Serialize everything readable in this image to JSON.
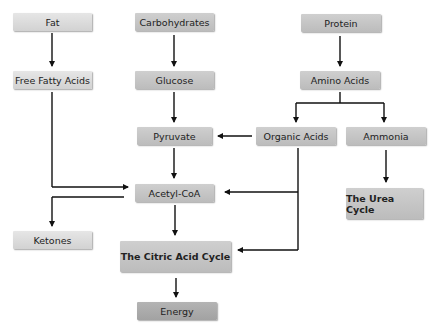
{
  "diagram": {
    "nodes": [
      {
        "id": "fat",
        "label": "Fat"
      },
      {
        "id": "carbs",
        "label": "Carbohydrates"
      },
      {
        "id": "protein",
        "label": "Protein"
      },
      {
        "id": "ffa",
        "label": "Free Fatty Acids"
      },
      {
        "id": "glucose",
        "label": "Glucose"
      },
      {
        "id": "amino",
        "label": "Amino Acids"
      },
      {
        "id": "pyruvate",
        "label": "Pyruvate"
      },
      {
        "id": "organic",
        "label": "Organic Acids"
      },
      {
        "id": "ammonia",
        "label": "Ammonia"
      },
      {
        "id": "acetyl",
        "label": "Acetyl-CoA"
      },
      {
        "id": "urea",
        "label": "The Urea Cycle"
      },
      {
        "id": "ketones",
        "label": "Ketones"
      },
      {
        "id": "citric",
        "label": "The Citric Acid Cycle"
      },
      {
        "id": "energy",
        "label": "Energy"
      }
    ],
    "edges": [
      {
        "from": "fat",
        "to": "ffa"
      },
      {
        "from": "carbs",
        "to": "glucose"
      },
      {
        "from": "protein",
        "to": "amino"
      },
      {
        "from": "glucose",
        "to": "pyruvate"
      },
      {
        "from": "amino",
        "to": "organic"
      },
      {
        "from": "amino",
        "to": "ammonia"
      },
      {
        "from": "organic",
        "to": "pyruvate"
      },
      {
        "from": "organic",
        "to": "acetyl"
      },
      {
        "from": "organic",
        "to": "citric"
      },
      {
        "from": "ammonia",
        "to": "urea"
      },
      {
        "from": "ffa",
        "to": "acetyl"
      },
      {
        "from": "pyruvate",
        "to": "acetyl"
      },
      {
        "from": "acetyl",
        "to": "ketones"
      },
      {
        "from": "acetyl",
        "to": "citric"
      },
      {
        "from": "citric",
        "to": "energy"
      }
    ]
  }
}
